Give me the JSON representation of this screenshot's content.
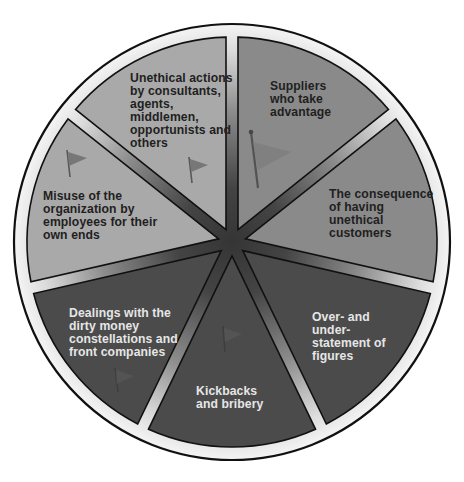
{
  "diagram": {
    "type": "segmented-wheel",
    "segment_count": 7,
    "colors": {
      "rim": "#e8e8e8",
      "outline": "#111111",
      "hub": "#3a3a3a",
      "light_segment": "#a9a9a9",
      "medium_segment": "#8a8a8a",
      "dark_segment": "#4a4a4a",
      "flag": "#6f6f6f"
    },
    "segments": [
      {
        "id": "suppliers",
        "label": "Suppliers\nwho take\nadvantage",
        "shade": "medium",
        "has_flag": true
      },
      {
        "id": "unethical-customers",
        "label": "The consequence\nof having\nunethical\ncustomers",
        "shade": "medium",
        "has_flag": false
      },
      {
        "id": "over-under-statement",
        "label": "Over- and\nunder-\nstatement of\nfigures",
        "shade": "dark",
        "has_flag": false
      },
      {
        "id": "kickbacks",
        "label": "Kickbacks\nand bribery",
        "shade": "dark",
        "has_flag": true
      },
      {
        "id": "dirty-money",
        "label": "Dealings with the\ndirty money\nconstellations and\nfront companies",
        "shade": "dark",
        "has_flag": true
      },
      {
        "id": "employee-misuse",
        "label": "Misuse of the\norganization by\nemployees for their\nown ends",
        "shade": "light",
        "has_flag": true
      },
      {
        "id": "third-parties",
        "label": "Unethical actions\nby consultants,\nagents,\nmiddlemen,\nopportunists and\nothers",
        "shade": "light",
        "has_flag": true
      }
    ]
  }
}
